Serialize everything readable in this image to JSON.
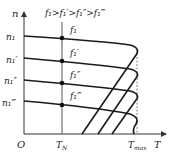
{
  "diagram": {
    "title_relation": "f₁>f₁′>f₁″>f₁‴",
    "y_axis_label": "n",
    "x_axis_label": "T",
    "origin_label": "O",
    "x_ticks": [
      {
        "label": "T",
        "sub": "N"
      },
      {
        "label": "T",
        "sub": "max"
      }
    ],
    "speed_levels": [
      {
        "label": "n₁",
        "frequency": "f₁"
      },
      {
        "label": "n₁′",
        "frequency": "f₁′"
      },
      {
        "label": "n₁″",
        "frequency": "f₁″"
      },
      {
        "label": "n₁‴",
        "frequency": "f₁‴"
      }
    ],
    "colors": {
      "curve": "#1a1a1a",
      "axis": "#333333",
      "dashed": "#777777",
      "guide": "#555555"
    }
  }
}
